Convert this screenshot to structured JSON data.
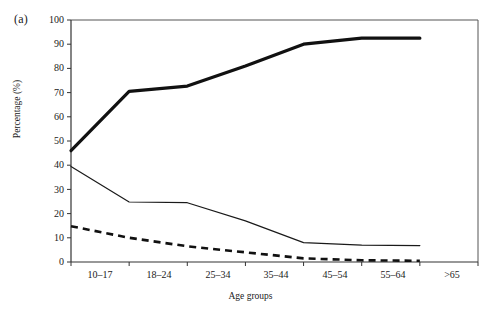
{
  "figure": {
    "panel_label": "(a)",
    "x_axis_title": "Age groups",
    "y_axis_title": "Percentage (%)"
  },
  "chart_data": {
    "type": "line",
    "title": "",
    "subtitle": "",
    "panel": "(a)",
    "xlabel": "Age groups",
    "ylabel": "Percentage (%)",
    "categories": [
      "10–17",
      "18–24",
      "25–34",
      "35–44",
      "45–54",
      "55–64",
      ">65"
    ],
    "xtick_labels": [
      "10–17",
      "18–24",
      "25–34",
      "35–44",
      "45–54",
      "55–64",
      ">65"
    ],
    "ytick_labels": [
      "0",
      "10",
      "20",
      "30",
      "40",
      "50",
      "60",
      "70",
      "80",
      "90",
      "100"
    ],
    "yticks": [
      0,
      10,
      20,
      30,
      40,
      50,
      60,
      70,
      80,
      90,
      100
    ],
    "ylim": [
      0,
      100
    ],
    "grid": false,
    "legend": "none",
    "legend_position": "none",
    "series": [
      {
        "name": "thick-solid-line",
        "style": "solid",
        "line_width": 3.2,
        "color": "#111111",
        "values": [
          46,
          70.5,
          72.7,
          81,
          90,
          92.5,
          92.5
        ]
      },
      {
        "name": "thin-solid-line",
        "style": "solid",
        "line_width": 1.2,
        "color": "#1a1a1a",
        "values": [
          39.5,
          24.8,
          24.5,
          17,
          8,
          7,
          6.8
        ]
      },
      {
        "name": "dashed-line",
        "style": "dashed",
        "line_width": 2.6,
        "color": "#111111",
        "values": [
          14.8,
          10,
          6.5,
          4,
          1.5,
          0.7,
          0.5
        ]
      }
    ]
  },
  "axes": {
    "frame_color": "#555555",
    "tick_color": "#333333"
  }
}
